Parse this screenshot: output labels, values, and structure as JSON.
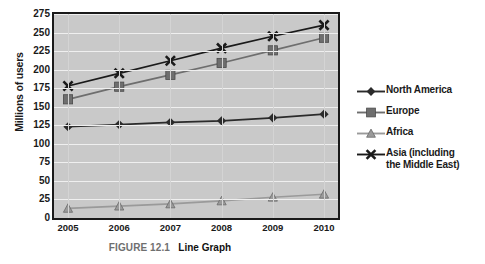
{
  "caption": {
    "figure_number": "FIGURE 12.1",
    "title": "Line Graph"
  },
  "chart_data": {
    "type": "line",
    "title": "",
    "subtitle": "",
    "xlabel": "",
    "ylabel": "Millions of users",
    "categories": [
      "2005",
      "2006",
      "2007",
      "2008",
      "2009",
      "2010"
    ],
    "x": [
      2005,
      2006,
      2007,
      2008,
      2009,
      2010
    ],
    "ylim": [
      0,
      275
    ],
    "ytick_labels": [
      "0",
      "25",
      "50",
      "75",
      "100",
      "125",
      "150",
      "175",
      "200",
      "225",
      "250",
      "275"
    ],
    "ytick_values": [
      0,
      25,
      50,
      75,
      100,
      125,
      150,
      175,
      200,
      225,
      250,
      275
    ],
    "grid": true,
    "legend_position": "right",
    "plot_background": "#c9c9c9",
    "series": [
      {
        "name": "North America",
        "marker": "diamond",
        "color": "#2b2b2b",
        "values": [
          123,
          126,
          129,
          131,
          135,
          140
        ]
      },
      {
        "name": "Europe",
        "marker": "square",
        "color": "#6e6e6e",
        "values": [
          160,
          177,
          193,
          209,
          226,
          243
        ]
      },
      {
        "name": "Africa",
        "marker": "triangle",
        "color": "#9a9a9a",
        "values": [
          13,
          16,
          19,
          23,
          28,
          32
        ]
      },
      {
        "name": "Asia (including the Middle East)",
        "marker": "cross",
        "color": "#1a1a1a",
        "values": [
          178,
          195,
          212,
          229,
          245,
          260
        ]
      }
    ],
    "legend_entries": [
      {
        "label": "North America",
        "marker": "diamond",
        "color": "#2b2b2b"
      },
      {
        "label": "Europe",
        "marker": "square",
        "color": "#6e6e6e"
      },
      {
        "label": "Africa",
        "marker": "triangle",
        "color": "#9a9a9a"
      },
      {
        "label": "Asia (including",
        "label2": "the Middle East)",
        "marker": "cross",
        "color": "#1a1a1a"
      }
    ]
  }
}
